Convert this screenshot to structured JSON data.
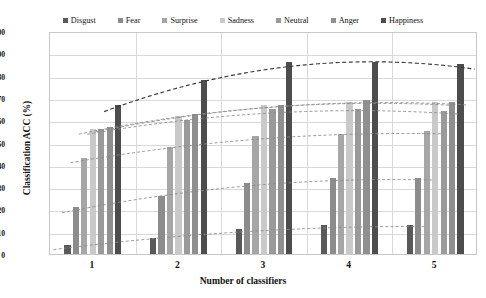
{
  "chart_data": {
    "type": "bar",
    "title": "",
    "xlabel": "Number of classifiers",
    "ylabel": "Classification ACC (%)",
    "categories": [
      "1",
      "2",
      "3",
      "4",
      "5"
    ],
    "ylim": [
      0,
      100
    ],
    "yticks": [
      0,
      10,
      20,
      30,
      40,
      50,
      60,
      70,
      80,
      90,
      100
    ],
    "grid": true,
    "legend_position": "top",
    "trendlines": "dashed polynomial per series",
    "series": [
      {
        "name": "Disgust",
        "color": "#595959",
        "values": [
          4,
          7,
          11,
          13,
          13
        ]
      },
      {
        "name": "Fear",
        "color": "#8c8c8c",
        "values": [
          21,
          26,
          32,
          34,
          34
        ]
      },
      {
        "name": "Surprise",
        "color": "#a6a6a6",
        "values": [
          43,
          48,
          53,
          54,
          55
        ]
      },
      {
        "name": "Sadness",
        "color": "#c9c9c9",
        "values": [
          56,
          62,
          67,
          68,
          68
        ]
      },
      {
        "name": "Neutral",
        "color": "#9a9a9a",
        "values": [
          56,
          60,
          65,
          65,
          64
        ]
      },
      {
        "name": "Anger",
        "color": "#8f8f8f",
        "values": [
          57,
          63,
          67,
          69,
          68
        ]
      },
      {
        "name": "Happiness",
        "color": "#4d4d4d",
        "values": [
          67,
          78,
          86,
          86,
          85
        ]
      }
    ]
  },
  "legend": {
    "items": [
      {
        "label": "Disgust"
      },
      {
        "label": "Fear"
      },
      {
        "label": "Surprise"
      },
      {
        "label": "Sadness"
      },
      {
        "label": "Neutral"
      },
      {
        "label": "Anger"
      },
      {
        "label": "Happiness"
      }
    ]
  }
}
